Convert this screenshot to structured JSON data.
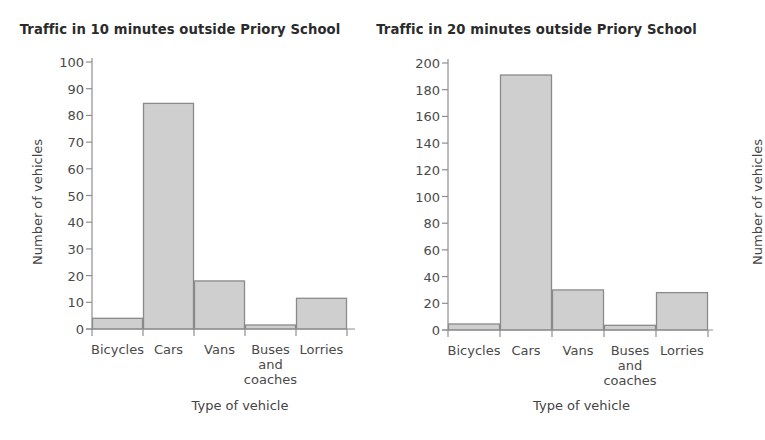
{
  "chart_data": [
    {
      "id": "traffic-10-minutes",
      "type": "bar",
      "title": "Traffic in 10 minutes outside Priory School",
      "xlabel": "Type of vehicle",
      "ylabel": "Number of vehicles",
      "categories": [
        "Bicycles",
        "Cars",
        "Vans",
        "Buses and coaches",
        "Lorries"
      ],
      "category_label_lines": [
        [
          "Bicycles"
        ],
        [
          "Cars"
        ],
        [
          "Vans"
        ],
        [
          "Buses",
          "and",
          "coaches"
        ],
        [
          "Lorries"
        ]
      ],
      "values": [
        4,
        84.5,
        18,
        1.5,
        11.5
      ],
      "ylim": [
        0,
        100
      ],
      "yticks": [
        0,
        10,
        20,
        30,
        40,
        50,
        60,
        70,
        80,
        90,
        100
      ],
      "ytick_labels": [
        "0",
        "10",
        "20",
        "30",
        "40",
        "50",
        "60",
        "70",
        "80",
        "90",
        "100"
      ],
      "grid": false,
      "legend": "none",
      "bar_fill": "#cfcfcf",
      "bar_stroke": "#8a8a8a",
      "axis_color": "#8f8f8f"
    },
    {
      "id": "traffic-20-minutes",
      "type": "bar",
      "title": "Traffic in 20 minutes outside Priory School",
      "xlabel": "Type of vehicle",
      "ylabel": "Number of vehicles",
      "categories": [
        "Bicycles",
        "Cars",
        "Vans",
        "Buses and coaches",
        "Lorries"
      ],
      "category_label_lines": [
        [
          "Bicycles"
        ],
        [
          "Cars"
        ],
        [
          "Vans"
        ],
        [
          "Buses",
          "and",
          "coaches"
        ],
        [
          "Lorries"
        ]
      ],
      "values": [
        4.5,
        191,
        30,
        3.5,
        28
      ],
      "ylim": [
        0,
        200
      ],
      "yticks": [
        0,
        20,
        40,
        60,
        80,
        100,
        120,
        140,
        160,
        180,
        200
      ],
      "ytick_labels": [
        "0",
        "20",
        "40",
        "60",
        "80",
        "100",
        "120",
        "140",
        "160",
        "180",
        "200"
      ],
      "grid": false,
      "legend": "none",
      "bar_fill": "#cfcfcf",
      "bar_stroke": "#8a8a8a",
      "axis_color": "#8f8f8f"
    }
  ],
  "left": {
    "title": "Traffic in 10 minutes outside Priory School",
    "ylabel": "Number of vehicles",
    "xlabel": "Type of vehicle"
  },
  "right": {
    "title": "Traffic in 20 minutes outside Priory School",
    "ylabel": "Number of vehicles",
    "xlabel": "Type of vehicle"
  }
}
